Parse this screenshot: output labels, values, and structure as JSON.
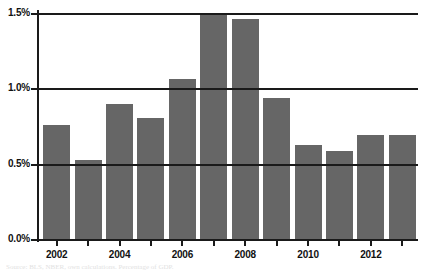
{
  "chart_data": {
    "type": "bar",
    "title": "",
    "subtitle": "",
    "xlabel": "",
    "ylabel": "",
    "categories": [
      "2002",
      "2003",
      "2004",
      "2005",
      "2006",
      "2007",
      "2008",
      "2009",
      "2010",
      "2011",
      "2012",
      "2013"
    ],
    "values": [
      0.76,
      0.53,
      0.9,
      0.81,
      1.07,
      1.5,
      1.47,
      0.94,
      0.63,
      0.59,
      0.7,
      0.7
    ],
    "value_labels": [
      "0.76%",
      "0.53%",
      "0.90%",
      "0.81%",
      "1.07%",
      "1.50%",
      "1.47%",
      "0.94%",
      "0.63%",
      "0.59%",
      "0.70%",
      "0.70%"
    ],
    "ylim": [
      0.0,
      1.5
    ],
    "y_ticks": [
      0.0,
      0.5,
      1.0,
      1.5
    ],
    "y_tick_labels": [
      "0.0%",
      "0.5%",
      "1.0%",
      "1.5%"
    ],
    "x_tick_labels": [
      "2002",
      "2004",
      "2006",
      "2008",
      "2010",
      "2012"
    ],
    "x_tick_indices": [
      0,
      2,
      4,
      6,
      8,
      10
    ],
    "grid": true,
    "grid_axis": "y",
    "legend": null,
    "legend_position": "none",
    "series_color": "#666666",
    "axis_color": "#1a1a1a",
    "background": "#ffffff"
  },
  "footer": {
    "source_note": "Source: BLS, NBER, own calculations. Percentage of GDP."
  }
}
